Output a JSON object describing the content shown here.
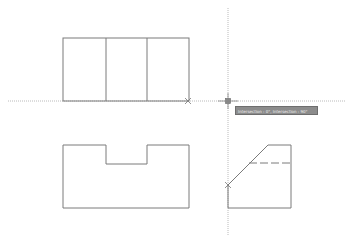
{
  "app": {
    "type": "CAD drawing viewport"
  },
  "colors": {
    "line": "#7a7a7a",
    "tracking_line": "#a8a8a8",
    "marker": "#777777",
    "tooltip_bg": "#8c8c8c",
    "tooltip_text": "#f2f2f2"
  },
  "tooltip": {
    "text": "Intersection : 0°, Intersection : 90°"
  },
  "drawing": {
    "front_view": {
      "x": 63,
      "y": 38,
      "width": 126,
      "height": 63,
      "dividers": [
        106,
        147
      ]
    },
    "top_view": {
      "points": "63,145 106,145 106,164 147,164 147,145 189,145 189,208 63,208"
    },
    "side_view": {
      "rect": {
        "x": 228,
        "y": 145,
        "width": 63,
        "height": 63
      },
      "chamfer": "228,185 268,145 291,145",
      "hidden_line_y": 163
    },
    "tracking": {
      "horizontal_y": 101,
      "vertical_x": 228
    },
    "markers": [
      {
        "x": 188,
        "y": 101
      },
      {
        "x": 228,
        "y": 101
      },
      {
        "x": 228,
        "y": 185
      }
    ]
  }
}
